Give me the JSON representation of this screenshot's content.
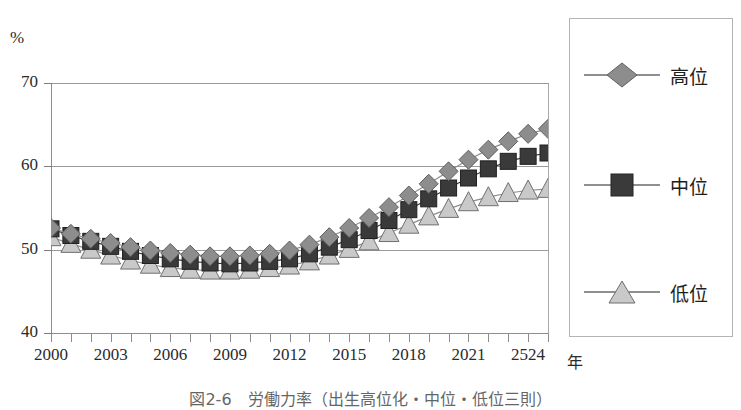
{
  "figure": {
    "unit_label": "%",
    "x_unit_label": "年",
    "caption": "図2-6　労働力率（出生高位化・中位・低位三則）"
  },
  "legend": {
    "items": [
      {
        "label": "高位",
        "marker": "diamond",
        "color": "#8d8d8d",
        "name": "high-variant"
      },
      {
        "label": "中位",
        "marker": "square",
        "color": "#3a3a3a",
        "name": "medium-variant"
      },
      {
        "label": "低位",
        "marker": "triangle",
        "color": "#c9c9c9",
        "name": "low-variant"
      }
    ]
  },
  "chart_data": {
    "type": "line",
    "title": "",
    "xlabel": "年",
    "ylabel": "%",
    "ylim": [
      40,
      70
    ],
    "yticks": [
      40,
      50,
      60,
      70
    ],
    "grid": true,
    "legend_position": "right",
    "x": [
      2000,
      2001,
      2002,
      2003,
      2004,
      2005,
      2006,
      2007,
      2008,
      2009,
      2010,
      2011,
      2012,
      2013,
      2014,
      2015,
      2016,
      2017,
      2018,
      2019,
      2020,
      2021,
      2022,
      2023,
      2024,
      2025
    ],
    "xtick_labels": [
      "2000",
      "2003",
      "2006",
      "2009",
      "2012",
      "2015",
      "2018",
      "2021",
      "2524"
    ],
    "xtick_values": [
      2000,
      2003,
      2006,
      2009,
      2012,
      2015,
      2018,
      2021,
      2024
    ],
    "series": [
      {
        "name": "高位",
        "marker": "diamond",
        "color": "#8d8d8d",
        "values": [
          52.6,
          51.9,
          51.3,
          50.8,
          50.3,
          49.9,
          49.6,
          49.4,
          49.2,
          49.2,
          49.3,
          49.5,
          49.9,
          50.6,
          51.5,
          52.6,
          53.8,
          55.1,
          56.5,
          57.9,
          59.4,
          60.8,
          62.0,
          63.0,
          63.9,
          64.5
        ]
      },
      {
        "name": "中位",
        "marker": "square",
        "color": "#3a3a3a",
        "values": [
          52.5,
          51.7,
          51.0,
          50.4,
          49.8,
          49.3,
          48.9,
          48.6,
          48.4,
          48.3,
          48.4,
          48.6,
          48.9,
          49.5,
          50.3,
          51.2,
          52.3,
          53.5,
          54.8,
          56.1,
          57.4,
          58.6,
          59.7,
          60.6,
          61.2,
          61.6
        ]
      },
      {
        "name": "低位",
        "marker": "triangle",
        "color": "#c9c9c9",
        "values": [
          51.5,
          50.7,
          50.0,
          49.3,
          48.7,
          48.2,
          47.8,
          47.6,
          47.5,
          47.5,
          47.6,
          47.8,
          48.1,
          48.6,
          49.3,
          50.1,
          51.0,
          52.0,
          53.0,
          54.0,
          54.9,
          55.7,
          56.3,
          56.8,
          57.1,
          57.3
        ]
      }
    ]
  }
}
